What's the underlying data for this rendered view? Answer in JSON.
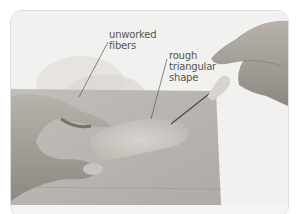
{
  "figure": {
    "annotations": [
      {
        "id": "unworked",
        "lines": [
          "unworked",
          "fibers"
        ]
      },
      {
        "id": "rough",
        "lines": [
          "rough",
          "triangular",
          "shape"
        ]
      }
    ],
    "colors": {
      "background": "#f2f2f1",
      "foam": "#b9b6b2",
      "skin": "#a9a39e",
      "wool": "#cfcac5",
      "label_text": "#5a5450",
      "border": "#dcdcdc"
    }
  }
}
